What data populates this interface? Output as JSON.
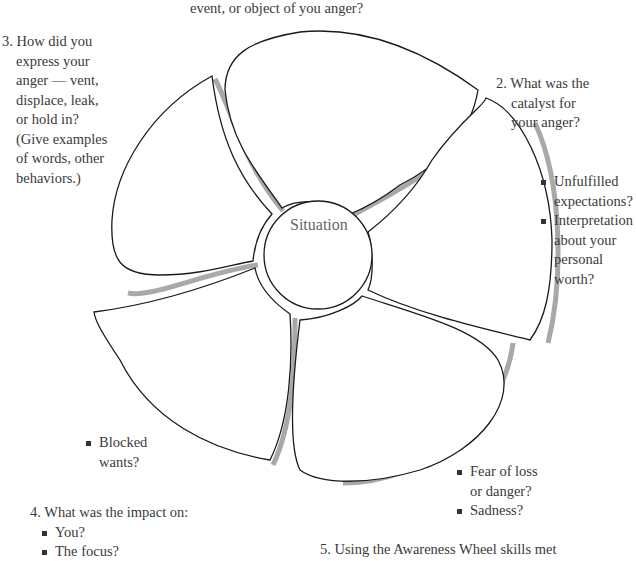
{
  "top_caption": "event, or object of you anger?",
  "center": {
    "label": "Situation"
  },
  "question_2": {
    "lines": [
      "2. What was the",
      "catalyst for",
      "your anger?"
    ],
    "bullets": [
      [
        "Unfulfilled",
        "expectations?"
      ],
      [
        "Interpretation",
        "about your",
        "personal",
        "worth?"
      ]
    ]
  },
  "question_3": {
    "lines": [
      "3. How did you",
      "express your",
      "anger — vent,",
      "displace, leak,",
      "or hold in?",
      "(Give examples",
      "of words, other",
      "behaviors.)"
    ]
  },
  "question_4": {
    "title": "4. What was the impact on:",
    "bullets": [
      "You?",
      "The focus?"
    ]
  },
  "question_5": {
    "title": "5. Using the Awareness Wheel skills met"
  },
  "petal_bullets": {
    "lower_left": [
      "Blocked",
      "wants?"
    ],
    "lower_right": [
      [
        "Fear of loss",
        "or danger?"
      ],
      [
        "Sadness?"
      ]
    ]
  },
  "colors": {
    "outline": "#1a1a1a",
    "shadow": "#9a9a9a",
    "text": "#3a3a3a"
  }
}
